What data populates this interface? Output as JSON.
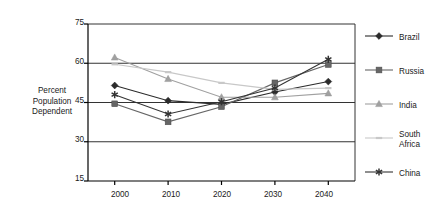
{
  "chart_data": {
    "type": "line",
    "title": "",
    "xlabel": "",
    "ylabel": "Percent\nPopulation\nDependent",
    "categories": [
      "2000",
      "2010",
      "2020",
      "2030",
      "2040"
    ],
    "x": [
      2000,
      2010,
      2020,
      2030,
      2040
    ],
    "xlim": [
      1995,
      2045
    ],
    "ylim": [
      15,
      75
    ],
    "yticks": [
      "15",
      "30",
      "45",
      "60",
      "75"
    ],
    "ytick_values": [
      15,
      30,
      45,
      60,
      75
    ],
    "grid": "horizontal",
    "legend_position": "right",
    "series": [
      {
        "name": "Brazil",
        "marker": "diamond",
        "color": "#2b2b2b",
        "values": [
          51.5,
          45.7,
          44.3,
          49.0,
          53.0
        ]
      },
      {
        "name": "Russia",
        "marker": "square",
        "color": "#666666",
        "values": [
          44.5,
          37.6,
          43.4,
          52.5,
          59.5
        ]
      },
      {
        "name": "India",
        "marker": "triangle",
        "color": "#a0a0a0",
        "values": [
          62.2,
          54.0,
          47.0,
          47.0,
          48.5
        ]
      },
      {
        "name": "South Africa",
        "marker": "dash",
        "color": "#c8c8c8",
        "values": [
          59.6,
          56.6,
          52.5,
          50.0,
          50.5
        ]
      },
      {
        "name": "China",
        "marker": "asterisk",
        "color": "#333333",
        "values": [
          48.0,
          40.6,
          45.3,
          50.5,
          61.5
        ]
      }
    ]
  },
  "legend": {
    "items": [
      {
        "label": "Brazil"
      },
      {
        "label": "Russia"
      },
      {
        "label": "India"
      },
      {
        "label": "South Africa"
      },
      {
        "label": "China"
      }
    ]
  },
  "colors": {
    "axis": "#000000",
    "gridline": "#333333",
    "background": "#ffffff"
  }
}
